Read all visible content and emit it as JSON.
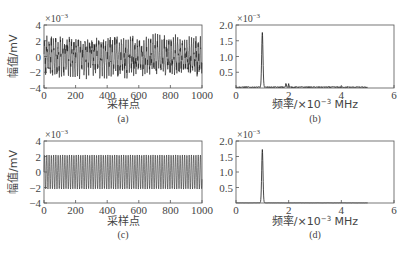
{
  "chart_data": [
    {
      "panel": "a",
      "type": "line",
      "caption": "(a)",
      "xlabel": "采样点",
      "ylabel": "幅值/mV",
      "y_multiplier": "×10⁻³",
      "xlim": [
        0,
        1000
      ],
      "ylim": [
        -4,
        4
      ],
      "xticks": [
        "0",
        "200",
        "400",
        "600",
        "800",
        "1000"
      ],
      "yticks": [
        "4",
        "2",
        "0",
        "−2",
        "−4"
      ],
      "description": "Noisy oscillating signal, amplitude roughly ±2 to ±3 ×10⁻³ mV over 1000 samples",
      "amplitude_approx": 2.5
    },
    {
      "panel": "b",
      "type": "line",
      "caption": "(b)",
      "xlabel": "频率/×10⁻³ MHz",
      "ylabel": "",
      "y_multiplier": "×10⁻³",
      "xlim": [
        0,
        6
      ],
      "ylim": [
        0,
        2.0
      ],
      "xticks": [
        "0",
        "2",
        "4",
        "6"
      ],
      "yticks": [
        "2.0",
        "1.5",
        "1.0",
        "0.5"
      ],
      "peaks": [
        {
          "x": 1.0,
          "y": 1.72
        },
        {
          "x": 1.9,
          "y": 0.12
        },
        {
          "x": 2.0,
          "y": 0.1
        }
      ],
      "noise_floor": 0.03,
      "data_extent_x": 5.0
    },
    {
      "panel": "c",
      "type": "line",
      "caption": "(c)",
      "xlabel": "采样点",
      "ylabel": "幅值/mV",
      "y_multiplier": "×10⁻³",
      "xlim": [
        0,
        1000
      ],
      "ylim": [
        -4,
        4
      ],
      "xticks": [
        "0",
        "200",
        "400",
        "600",
        "800",
        "1000"
      ],
      "yticks": [
        "4",
        "2",
        "0",
        "−2",
        "−4"
      ],
      "description": "Clean sinusoid, amplitude about ±2.2 ×10⁻³ mV over 1000 samples",
      "amplitude_approx": 2.2
    },
    {
      "panel": "d",
      "type": "line",
      "caption": "(d)",
      "xlabel": "频率/×10⁻³ MHz",
      "ylabel": "",
      "y_multiplier": "×10⁻³",
      "xlim": [
        0,
        6
      ],
      "ylim": [
        0,
        2.0
      ],
      "xticks": [
        "0",
        "2",
        "4",
        "6"
      ],
      "yticks": [
        "2.0",
        "1.5",
        "1.0",
        "0.5"
      ],
      "peaks": [
        {
          "x": 1.0,
          "y": 1.72
        }
      ],
      "noise_floor": 0.005,
      "data_extent_x": 5.0
    }
  ],
  "labels": {
    "a": {
      "caption": "(a)",
      "xlabel": "采样点",
      "ylabel": "幅值/mV",
      "exp": "×10",
      "exp_pow": "−3"
    },
    "b": {
      "caption": "(b)",
      "xlabel": "频率/×10",
      "xlabel_pow": "−3",
      "xlabel_unit": " MHz",
      "exp": "×10",
      "exp_pow": "−3"
    },
    "c": {
      "caption": "(c)",
      "xlabel": "采样点",
      "ylabel": "幅值/mV",
      "exp": "×10",
      "exp_pow": "−3"
    },
    "d": {
      "caption": "(d)",
      "xlabel": "频率/×10",
      "xlabel_pow": "−3",
      "xlabel_unit": " MHz",
      "exp": "×10",
      "exp_pow": "−3"
    }
  }
}
